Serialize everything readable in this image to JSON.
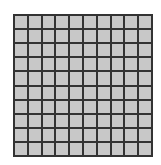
{
  "grid": {
    "rows": 10,
    "columns": 10,
    "cell_color": "#c8c8c8",
    "line_color": "#333333",
    "background": "#ffffff"
  }
}
